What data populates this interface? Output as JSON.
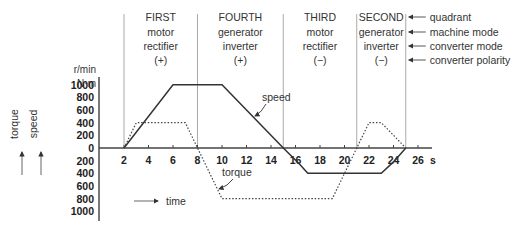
{
  "quadrants": [
    {
      "name": "FIRST",
      "machine_mode": "motor",
      "converter_mode": "rectifier",
      "polarity": "(+)",
      "t_start": 2,
      "t_end": 8
    },
    {
      "name": "FOURTH",
      "machine_mode": "generator",
      "converter_mode": "inverter",
      "polarity": "(+)",
      "t_start": 8,
      "t_end": 15
    },
    {
      "name": "THIRD",
      "machine_mode": "motor",
      "converter_mode": "rectifier",
      "polarity": "(−)",
      "t_start": 15,
      "t_end": 21
    },
    {
      "name": "SECOND",
      "machine_mode": "generator",
      "converter_mode": "inverter",
      "polarity": "(−)",
      "t_start": 21,
      "t_end": 25
    }
  ],
  "row_legend": [
    "quadrant",
    "machine mode",
    "converter mode",
    "converter polarity"
  ],
  "axis": {
    "y_unit_speed": "r/min",
    "y_unit_torque": "N·m",
    "y_ticks_pos": [
      "1000",
      "800",
      "600",
      "400",
      "200",
      "0"
    ],
    "y_ticks_neg": [
      "200",
      "400",
      "600",
      "800",
      "1000"
    ],
    "x_ticks": [
      "2",
      "4",
      "6",
      "8",
      "10",
      "12",
      "14",
      "16",
      "18",
      "20",
      "22",
      "24",
      "26"
    ],
    "x_unit": "s",
    "vertical_labels": [
      "torque",
      "speed"
    ],
    "time_label": "time"
  },
  "annotations": {
    "speed": "speed",
    "torque": "torque"
  },
  "chart_data": {
    "type": "line",
    "title": "",
    "xlabel": "time (s)",
    "ylabel": "speed (r/min) / torque (N·m)",
    "xlim": [
      0,
      27
    ],
    "ylim": [
      -1000,
      1000
    ],
    "grid": false,
    "series": [
      {
        "name": "speed",
        "style": "solid",
        "x": [
          2,
          6,
          10,
          15,
          16.3,
          17,
          23,
          24,
          25
        ],
        "y": [
          0,
          1000,
          1000,
          0,
          -250,
          -400,
          -400,
          -220,
          0
        ]
      },
      {
        "name": "torque",
        "style": "dotted",
        "x": [
          2,
          3,
          7,
          10,
          19,
          22,
          23,
          25
        ],
        "y": [
          0,
          400,
          400,
          -800,
          -800,
          400,
          400,
          0
        ]
      }
    ],
    "quadrant_boundaries_s": [
      2,
      8,
      15,
      21,
      25
    ]
  }
}
